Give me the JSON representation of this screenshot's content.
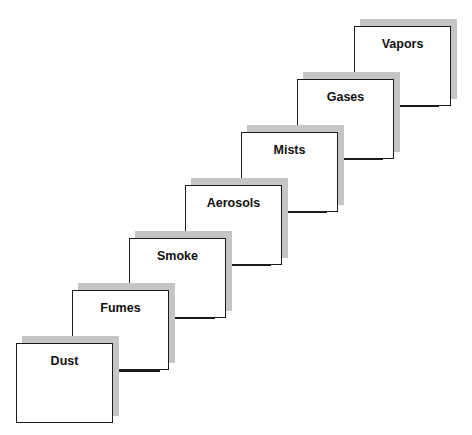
{
  "diagram": {
    "type": "staircase",
    "colors": {
      "box_border": "#1a1a1a",
      "box_fill": "#ffffff",
      "shadow": "#c3c6c3"
    },
    "steps": [
      {
        "label": "Dust",
        "x": 16,
        "y": 343
      },
      {
        "label": "Fumes",
        "x": 72,
        "y": 290
      },
      {
        "label": "Smoke",
        "x": 129,
        "y": 238
      },
      {
        "label": "Aerosols",
        "x": 185,
        "y": 185
      },
      {
        "label": "Mists",
        "x": 241,
        "y": 132
      },
      {
        "label": "Gases",
        "x": 297,
        "y": 79
      },
      {
        "label": "Vapors",
        "x": 354,
        "y": 26
      }
    ]
  }
}
